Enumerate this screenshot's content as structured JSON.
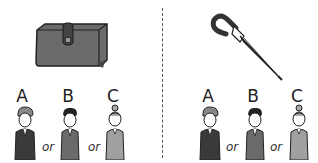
{
  "panels": [
    {
      "object": "wallet",
      "options": [
        {
          "letter": "A",
          "figure": "man-with-cap"
        },
        {
          "letter": "B",
          "figure": "young-man"
        },
        {
          "letter": "C",
          "figure": "woman-with-bun"
        }
      ],
      "separator": "or"
    },
    {
      "object": "umbrella",
      "options": [
        {
          "letter": "A",
          "figure": "man-with-cap"
        },
        {
          "letter": "B",
          "figure": "young-man"
        },
        {
          "letter": "C",
          "figure": "woman-with-bun"
        }
      ],
      "separator": "or"
    }
  ],
  "colors": {
    "ink": "#222222",
    "wallet": "#6b6b6b",
    "coat_dark": "#3a3a3a",
    "coat_mid": "#7a7a7a",
    "coat_light": "#a0a0a0"
  }
}
